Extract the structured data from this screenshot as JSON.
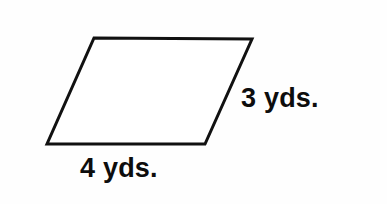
{
  "figure": {
    "kind": "parallelogram-diagram",
    "background_color": "#fefefe",
    "stroke_color": "#111111",
    "fill_color": "#ffffff",
    "stroke_width": 3,
    "text_color": "#0d0d0d",
    "shape": {
      "name": "parallelogram",
      "vertices": [
        {
          "name": "top-left",
          "x": 94,
          "y": 38
        },
        {
          "name": "top-right",
          "x": 252,
          "y": 39
        },
        {
          "name": "bottom-right",
          "x": 205,
          "y": 144
        },
        {
          "name": "bottom-left",
          "x": 47,
          "y": 144
        }
      ],
      "points_attr": "94,38 252,39 205,144 47,144"
    },
    "labels": {
      "bottom_side": "4 yds.",
      "right_side": "3 yds."
    }
  },
  "chart_data": {
    "type": "diagram",
    "title": "",
    "shape": "parallelogram",
    "measurements": [
      {
        "side": "base",
        "value": 4,
        "unit": "yds.",
        "label": "4 yds."
      },
      {
        "side": "slant-side",
        "value": 3,
        "unit": "yds.",
        "label": "3 yds."
      }
    ]
  }
}
